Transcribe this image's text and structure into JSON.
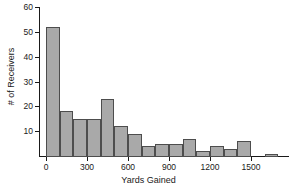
{
  "chart_data": {
    "type": "bar",
    "title": "",
    "xlabel": "Yards Gained",
    "ylabel": "# of Receivers",
    "bin_width": 100,
    "xlim": [
      0,
      1700
    ],
    "ylim": [
      0,
      60
    ],
    "grid": false,
    "legend": "none",
    "bar_fill_color": "#a9a9a9",
    "bar_border_color": "#4d4d4d",
    "axis_color": "#1a1a1a",
    "background_color": "#ffffff",
    "xticks": [
      0,
      300,
      600,
      900,
      1200,
      1500
    ],
    "xtick_labels": [
      "0",
      "300",
      "600",
      "900",
      "1200",
      "1500"
    ],
    "yticks": [
      10,
      20,
      30,
      40,
      50,
      60
    ],
    "ytick_labels": [
      "10",
      "20",
      "30",
      "40",
      "50",
      "60"
    ],
    "categories": [
      "0-100",
      "100-200",
      "200-300",
      "300-400",
      "400-500",
      "500-600",
      "600-700",
      "700-800",
      "800-900",
      "900-1000",
      "1000-1100",
      "1100-1200",
      "1200-1300",
      "1300-1400",
      "1400-1500",
      "1500-1600",
      "1600-1700"
    ],
    "bin_starts": [
      0,
      100,
      200,
      300,
      400,
      500,
      600,
      700,
      800,
      900,
      1000,
      1100,
      1200,
      1300,
      1400,
      1500,
      1600
    ],
    "values": [
      52,
      18,
      15,
      15,
      23,
      12,
      9,
      4,
      5,
      5,
      7,
      2,
      4,
      3,
      6,
      0,
      1
    ]
  }
}
